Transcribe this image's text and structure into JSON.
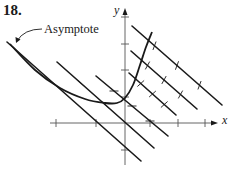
{
  "figure": {
    "problem_number": "18.",
    "annotation": "Asymptote",
    "x_axis_label": "x",
    "y_axis_label": "y",
    "colors": {
      "ink": "#1a1a1a",
      "axis": "#555555",
      "background": "#ffffff"
    }
  },
  "geometry": {
    "y_axis": {
      "x": 125,
      "y_top": 8,
      "y_bottom": 165,
      "ticks_y": [
        17,
        44,
        70,
        97,
        150
      ]
    },
    "x_axis": {
      "y": 123,
      "x_left": 50,
      "x_right": 218,
      "ticks_x": [
        56,
        96,
        150,
        178,
        205
      ]
    },
    "isoclines": [
      {
        "x1": 7,
        "y1": 42,
        "x2": 141,
        "y2": 161,
        "role": "asymptote"
      },
      {
        "x1": 57,
        "y1": 62,
        "x2": 154,
        "y2": 148
      },
      {
        "x1": 96,
        "y1": 76,
        "x2": 168,
        "y2": 136
      },
      {
        "x1": 129,
        "y1": 73,
        "x2": 176,
        "y2": 115
      },
      {
        "x1": 131,
        "y1": 51,
        "x2": 197,
        "y2": 109
      },
      {
        "x1": 132,
        "y1": 26,
        "x2": 222,
        "y2": 105
      }
    ],
    "solution_curve": [
      [
        10,
        44
      ],
      [
        35,
        70
      ],
      [
        60,
        88
      ],
      [
        85,
        99
      ],
      [
        105,
        103
      ],
      [
        117,
        103
      ],
      [
        125,
        98
      ],
      [
        133,
        85
      ],
      [
        140,
        65
      ],
      [
        146,
        47
      ],
      [
        152,
        32
      ]
    ],
    "asymptote_leader": {
      "from": [
        42,
        29
      ],
      "ctrl": [
        24,
        29
      ],
      "to": [
        17,
        41
      ]
    }
  }
}
